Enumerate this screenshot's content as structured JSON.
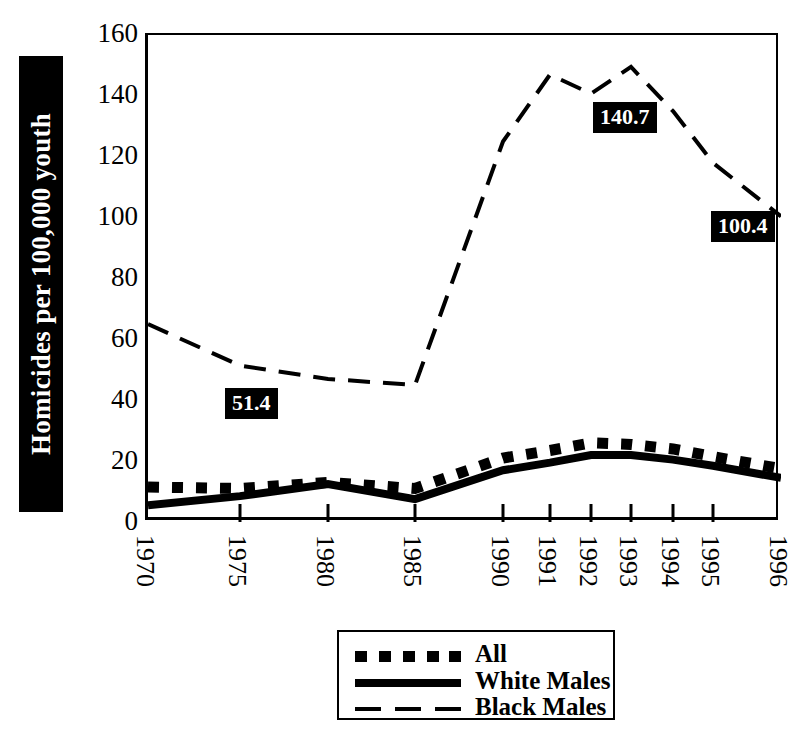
{
  "chart_data": {
    "type": "line",
    "title": "",
    "xlabel": "",
    "ylabel": "Homicides per 100,000 youth",
    "categories": [
      "1970",
      "1975",
      "1980",
      "1985",
      "1990",
      "1991",
      "1992",
      "1993",
      "1994",
      "1995",
      "1996"
    ],
    "x": [
      1970,
      1975,
      1980,
      1985,
      1990,
      1991,
      1992,
      1993,
      1994,
      1995,
      1996
    ],
    "ylim": [
      0,
      160
    ],
    "yticks": [
      0,
      20,
      40,
      60,
      80,
      100,
      120,
      140,
      160
    ],
    "grid": false,
    "legend_position": "bottom-center",
    "series": [
      {
        "name": "All",
        "style": "thick-dotted",
        "values": [
          11.5,
          11.0,
          13.0,
          11.0,
          21.0,
          23.5,
          26.0,
          25.5,
          24.0,
          21.5,
          17.5
        ]
      },
      {
        "name": "White Males",
        "style": "thick-solid",
        "values": [
          5.5,
          8.5,
          12.5,
          7.5,
          17.0,
          19.5,
          22.0,
          22.0,
          20.5,
          18.5,
          14.5
        ]
      },
      {
        "name": "Black Males",
        "style": "thin-dashed",
        "values": [
          65.0,
          51.4,
          47.0,
          45.0,
          125.0,
          147.0,
          140.7,
          149.5,
          135.0,
          118.0,
          100.4
        ]
      }
    ],
    "annotations": [
      {
        "text": "51.4",
        "series": "Black Males",
        "x": 1975,
        "value": 51.4
      },
      {
        "text": "140.7",
        "series": "Black Males",
        "x": 1992,
        "value": 140.7
      },
      {
        "text": "100.4",
        "series": "Black Males",
        "x": 1996,
        "value": 100.4
      }
    ],
    "colors": {
      "ink": "#000000",
      "background": "#ffffff",
      "callout_background": "#000000",
      "callout_text": "#ffffff"
    }
  },
  "axis": {
    "y_title": "Homicides per 100,000 youth",
    "y_ticks": [
      "160",
      "140",
      "120",
      "100",
      "80",
      "60",
      "40",
      "20",
      "0"
    ],
    "x_ticks": [
      "1970",
      "1975",
      "1980",
      "1985",
      "1990",
      "1991",
      "1992",
      "1993",
      "1994",
      "1995",
      "1996"
    ]
  },
  "legend": {
    "items": [
      {
        "label": "All",
        "swatch": "thick-dotted-swatch"
      },
      {
        "label": "White Males",
        "swatch": "thick-solid-swatch"
      },
      {
        "label": "Black Males",
        "swatch": "thin-dashed-swatch"
      }
    ]
  },
  "callouts": {
    "low": "51.4",
    "mid": "140.7",
    "end": "100.4"
  }
}
